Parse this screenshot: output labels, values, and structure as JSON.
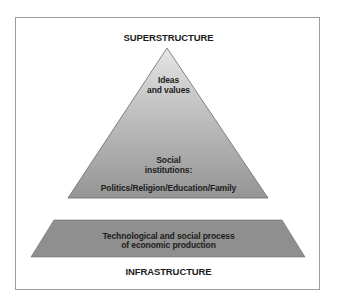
{
  "diagram": {
    "top_label": "SUPERSTRUCTURE",
    "bottom_label": "INFRASTRUCTURE",
    "pyramid": {
      "top_text": {
        "line1": "Ideas",
        "line2": "and values"
      },
      "middle_text": {
        "line1": "Social",
        "line2": "institutions:"
      },
      "bottom_text": "Politics/Religion/Education/Family",
      "gradient_top_color": "#e4e4e4",
      "gradient_bottom_color": "#969696"
    },
    "base": {
      "line1": "Technological and social process",
      "line2": "of economic production",
      "fill_color": "#8f8f8f"
    },
    "border_color": "#9c9c9c",
    "text_color": "#1c1c1c"
  }
}
